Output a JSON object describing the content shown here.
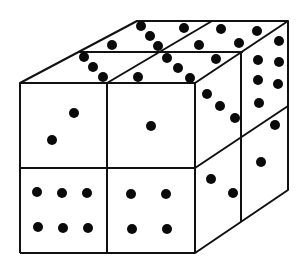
{
  "diagram": {
    "colors": {
      "background": "#ffffff",
      "line": "#111111",
      "pip": "#0a0a0a"
    },
    "faces": {
      "front": {
        "cells": [
          {
            "position": "top-left",
            "pips": 2
          },
          {
            "position": "top-right",
            "pips": 1
          },
          {
            "position": "bottom-left",
            "pips": 6
          },
          {
            "position": "bottom-right",
            "pips": 4
          }
        ]
      },
      "top": {
        "cells": [
          {
            "position": "back-left",
            "pips": 3
          },
          {
            "position": "back-right",
            "pips": 4
          },
          {
            "position": "front-left",
            "pips": 3
          },
          {
            "position": "front-right",
            "pips": 5
          }
        ]
      },
      "right": {
        "cells": [
          {
            "position": "top-front",
            "pips": 3
          },
          {
            "position": "top-back",
            "pips": 6
          },
          {
            "position": "bottom-front",
            "pips": 2
          },
          {
            "position": "bottom-back",
            "pips": 2
          }
        ]
      }
    },
    "pips": [
      [
        141,
        26
      ],
      [
        150,
        36
      ],
      [
        158,
        46
      ],
      [
        112,
        45
      ],
      [
        184,
        28
      ],
      [
        199,
        45
      ],
      [
        221,
        29
      ],
      [
        239,
        43
      ],
      [
        257,
        31
      ],
      [
        84,
        57
      ],
      [
        93,
        67
      ],
      [
        103,
        77
      ],
      [
        167,
        58
      ],
      [
        178,
        68
      ],
      [
        190,
        78
      ],
      [
        138,
        77
      ],
      [
        216,
        59
      ],
      [
        207,
        94
      ],
      [
        220,
        106
      ],
      [
        235,
        118
      ],
      [
        279,
        41
      ],
      [
        258,
        60
      ],
      [
        279,
        62
      ],
      [
        258,
        80
      ],
      [
        278,
        84
      ],
      [
        259,
        103
      ],
      [
        275,
        125
      ],
      [
        261,
        162
      ],
      [
        211,
        179
      ],
      [
        233,
        193
      ],
      [
        74,
        113
      ],
      [
        52,
        140
      ],
      [
        151,
        126
      ],
      [
        37,
        192
      ],
      [
        62,
        193
      ],
      [
        87,
        193
      ],
      [
        38,
        227
      ],
      [
        63,
        228
      ],
      [
        88,
        228
      ],
      [
        131,
        194
      ],
      [
        166,
        194
      ],
      [
        132,
        229
      ],
      [
        167,
        229
      ]
    ]
  }
}
